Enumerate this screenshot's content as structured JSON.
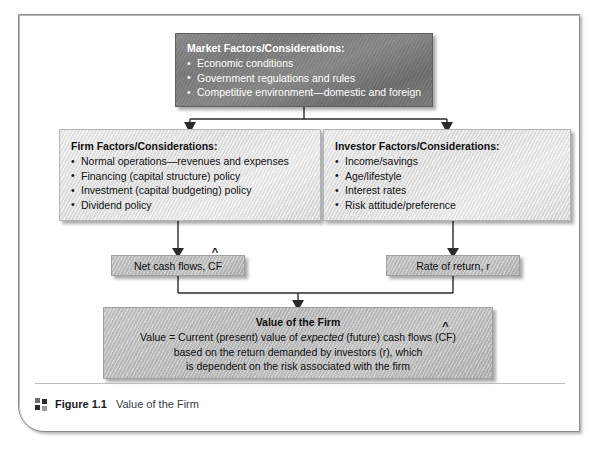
{
  "figure": {
    "caption_icon": "four-squares-icon",
    "caption_label": "Figure 1.1",
    "caption_text": "Value of the Firm"
  },
  "diagram": {
    "type": "flowchart",
    "colors": {
      "top_box_fill": "#7f7f7f",
      "tier_box_fill": "#e6e6e7",
      "flow_box_fill": "#c2c2c3",
      "value_box_fill": "#c2c2c3",
      "connector": "#2b2b2d",
      "frame_border": "#8c8c8f"
    },
    "market_box": {
      "title": "Market Factors/Considerations:",
      "bullets": [
        "Economic conditions",
        "Government regulations and rules",
        "Competitive environment—domestic and foreign"
      ]
    },
    "firm_box": {
      "title": "Firm Factors/Considerations:",
      "bullets": [
        "Normal operations—revenues and expenses",
        "Financing (capital structure) policy",
        "Investment (capital budgeting) policy",
        "Dividend policy"
      ]
    },
    "investor_box": {
      "title": "Investor Factors/Considerations:",
      "bullets": [
        "Income/savings",
        "Age/lifestyle",
        "Interest rates",
        "Risk attitude/preference"
      ]
    },
    "cash_flow_box": {
      "prefix": "Net cash flows, ",
      "symbol": "CF",
      "hat": "^"
    },
    "rate_box": {
      "label": "Rate of return, r"
    },
    "value_box": {
      "title": "Value of the Firm",
      "line1_a": "Value = Current (present) value of ",
      "line1_em": "expected",
      "line1_b": " (future) cash flows (",
      "line1_symbol": "CF",
      "line1_hat": "^",
      "line1_c": ")",
      "line2": "based on the return demanded by investors (r), which",
      "line3": "is dependent on the risk associated with the firm"
    }
  }
}
